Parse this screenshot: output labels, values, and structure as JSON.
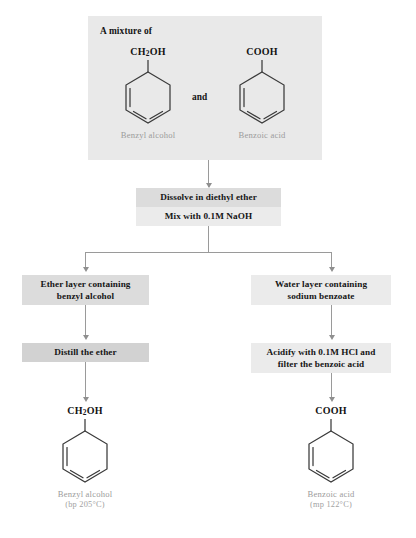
{
  "figure": {
    "kind": "separation-flowchart"
  },
  "colors": {
    "panel_light": "#ebebeb",
    "panel_mid": "#dcdcdc",
    "panel_dark": "#d2d2d2",
    "mixture_panel": "#e9e9e9",
    "connector": "#9a9a9a",
    "text": "#161616",
    "caption": "#9b9b9b",
    "structure_line": "#3a3a3a"
  },
  "mixture": {
    "title": "A mixture of",
    "conjunction": "and",
    "left_compound": {
      "formula_prefix": "CH",
      "formula_sub": "2",
      "formula_suffix": "OH",
      "name": "Benzyl alcohol"
    },
    "right_compound": {
      "formula_prefix": "COOH",
      "formula_sub": "",
      "formula_suffix": "",
      "name": "Benzoic acid"
    }
  },
  "steps": {
    "dissolve": "Dissolve in diethyl ether",
    "mix": "Mix with 0.1M NaOH",
    "ether_layer_line1": "Ether layer containing",
    "ether_layer_line2": "benzyl alcohol",
    "water_layer_line1": "Water layer containing",
    "water_layer_line2": "sodium benzoate",
    "distill": "Distill the ether",
    "acidify_line1": "Acidify with 0.1M HCl and",
    "acidify_line2": "filter the benzoic acid"
  },
  "products": {
    "left": {
      "formula_prefix": "CH",
      "formula_sub": "2",
      "formula_suffix": "OH",
      "name": "Benzyl alcohol",
      "property": "(bp 205°C)"
    },
    "right": {
      "formula_prefix": "COOH",
      "formula_sub": "",
      "formula_suffix": "",
      "name": "Benzoic acid",
      "property": "(mp 122°C)"
    }
  }
}
